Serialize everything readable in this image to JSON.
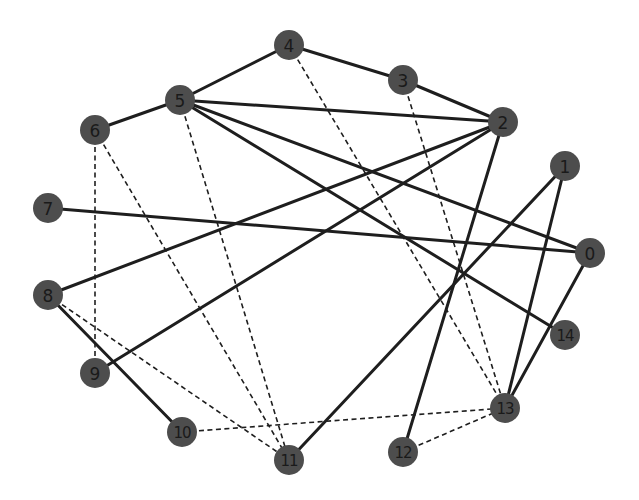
{
  "graph": {
    "node_color": "#4d4d4d",
    "edge_color": "#1e1e1e",
    "node_radius": 15,
    "nodes": [
      {
        "id": "0",
        "label": "0",
        "x": 590,
        "y": 253
      },
      {
        "id": "1",
        "label": "1",
        "x": 565,
        "y": 166
      },
      {
        "id": "2",
        "label": "2",
        "x": 503,
        "y": 122
      },
      {
        "id": "3",
        "label": "3",
        "x": 403,
        "y": 80
      },
      {
        "id": "4",
        "label": "4",
        "x": 289,
        "y": 45
      },
      {
        "id": "5",
        "label": "5",
        "x": 180,
        "y": 100
      },
      {
        "id": "6",
        "label": "6",
        "x": 95,
        "y": 130
      },
      {
        "id": "7",
        "label": "7",
        "x": 48,
        "y": 208
      },
      {
        "id": "8",
        "label": "8",
        "x": 48,
        "y": 295
      },
      {
        "id": "9",
        "label": "9",
        "x": 95,
        "y": 373
      },
      {
        "id": "10",
        "label": "10",
        "x": 182,
        "y": 432
      },
      {
        "id": "11",
        "label": "11",
        "x": 289,
        "y": 460
      },
      {
        "id": "12",
        "label": "12",
        "x": 403,
        "y": 452
      },
      {
        "id": "13",
        "label": "13",
        "x": 505,
        "y": 408
      },
      {
        "id": "14",
        "label": "14",
        "x": 565,
        "y": 335
      }
    ],
    "edges": [
      {
        "source": "4",
        "target": "3",
        "style": "solid"
      },
      {
        "source": "3",
        "target": "2",
        "style": "solid"
      },
      {
        "source": "5",
        "target": "4",
        "style": "solid"
      },
      {
        "source": "5",
        "target": "6",
        "style": "solid"
      },
      {
        "source": "5",
        "target": "2",
        "style": "solid"
      },
      {
        "source": "5",
        "target": "0",
        "style": "solid"
      },
      {
        "source": "5",
        "target": "14",
        "style": "solid"
      },
      {
        "source": "2",
        "target": "8",
        "style": "solid"
      },
      {
        "source": "2",
        "target": "9",
        "style": "solid"
      },
      {
        "source": "2",
        "target": "12",
        "style": "solid"
      },
      {
        "source": "7",
        "target": "0",
        "style": "solid"
      },
      {
        "source": "1",
        "target": "11",
        "style": "solid"
      },
      {
        "source": "1",
        "target": "13",
        "style": "solid"
      },
      {
        "source": "0",
        "target": "13",
        "style": "solid"
      },
      {
        "source": "8",
        "target": "10",
        "style": "solid"
      },
      {
        "source": "4",
        "target": "13",
        "style": "dashed"
      },
      {
        "source": "3",
        "target": "13",
        "style": "dashed"
      },
      {
        "source": "5",
        "target": "11",
        "style": "dashed"
      },
      {
        "source": "6",
        "target": "11",
        "style": "dashed"
      },
      {
        "source": "6",
        "target": "9",
        "style": "dashed"
      },
      {
        "source": "8",
        "target": "11",
        "style": "dashed"
      },
      {
        "source": "10",
        "target": "13",
        "style": "dashed"
      },
      {
        "source": "12",
        "target": "13",
        "style": "dashed"
      }
    ]
  }
}
